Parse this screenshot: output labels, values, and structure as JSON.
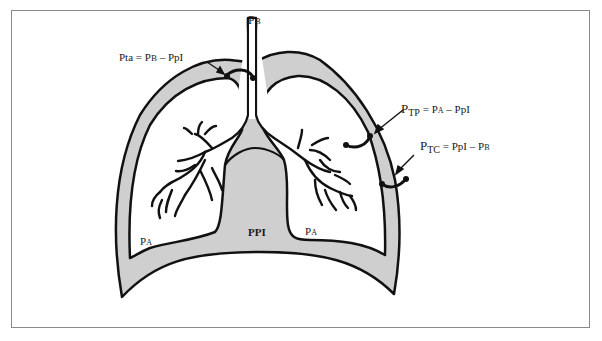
{
  "diagram": {
    "colors": {
      "pleural_fill": "#cfcfcf",
      "outline": "#111111",
      "frame": "#8a8a8a",
      "background": "#ffffff"
    },
    "labels": {
      "airway_opening": {
        "main": "P",
        "sub": "B"
      },
      "transairway": {
        "text": "Pta = PB – PpI",
        "lhs": "Pta",
        "eq": " = ",
        "p1": "P",
        "p1sub": "B",
        "minus": " – ",
        "p2": "PpI"
      },
      "transpulmonary": {
        "lhs_main": "P",
        "lhs_sub": "TP",
        "eq": " = ",
        "p1": "P",
        "p1sub": "A",
        "minus": " – ",
        "p2": "PpI"
      },
      "transchest": {
        "lhs_main": "P",
        "lhs_sub": "TC",
        "eq": " = ",
        "p1": "PpI",
        "minus": " – ",
        "p2": "P",
        "p2sub": "B"
      },
      "alveolar_left": {
        "main": "P",
        "sub": "A"
      },
      "alveolar_right": {
        "main": "P",
        "sub": "A"
      },
      "pleural": {
        "text": "PPI"
      }
    }
  }
}
